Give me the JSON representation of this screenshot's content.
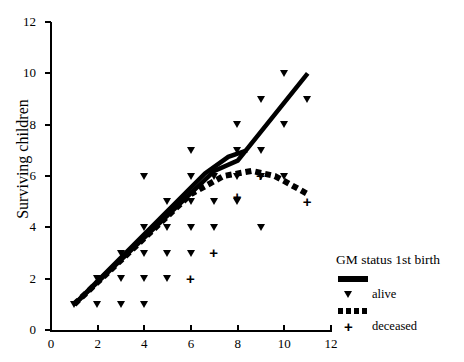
{
  "chart_data": {
    "type": "scatter",
    "title": "",
    "xlabel": "",
    "ylabel": "Surviving children",
    "xlim": [
      0,
      12
    ],
    "ylim": [
      0,
      12
    ],
    "xticks": [
      0,
      2,
      4,
      6,
      8,
      10,
      12
    ],
    "yticks": [
      0,
      2,
      4,
      6,
      8,
      10,
      12
    ],
    "grid": false,
    "legend": {
      "position": "right",
      "title": "GM status 1st birth",
      "entries": [
        {
          "key": "solid-line",
          "label": ""
        },
        {
          "key": "triangle-marker",
          "label": "alive"
        },
        {
          "key": "dashed-line",
          "label": ""
        },
        {
          "key": "plus-marker",
          "label": "deceased"
        }
      ]
    },
    "series": [
      {
        "name": "alive",
        "marker": "triangle-down",
        "points": [
          [
            1,
            1
          ],
          [
            2,
            1
          ],
          [
            3,
            1
          ],
          [
            4,
            1
          ],
          [
            2,
            2
          ],
          [
            3,
            2
          ],
          [
            4,
            2
          ],
          [
            5,
            2
          ],
          [
            3,
            3
          ],
          [
            4,
            3
          ],
          [
            5,
            3
          ],
          [
            6,
            3
          ],
          [
            4,
            4
          ],
          [
            5,
            4
          ],
          [
            6,
            4
          ],
          [
            7,
            4
          ],
          [
            9,
            4
          ],
          [
            5,
            5
          ],
          [
            6,
            5
          ],
          [
            7,
            5
          ],
          [
            8,
            5
          ],
          [
            4,
            6
          ],
          [
            6,
            6
          ],
          [
            7,
            6
          ],
          [
            8,
            6
          ],
          [
            9,
            6
          ],
          [
            10,
            6
          ],
          [
            6,
            7
          ],
          [
            8,
            7
          ],
          [
            9,
            7
          ],
          [
            8,
            8
          ],
          [
            10,
            8
          ],
          [
            9,
            9
          ],
          [
            11,
            9
          ],
          [
            10,
            10
          ]
        ]
      },
      {
        "name": "deceased",
        "marker": "plus",
        "points": [
          [
            6,
            2
          ],
          [
            7,
            3
          ],
          [
            8,
            5.2
          ],
          [
            9,
            6
          ],
          [
            11,
            5
          ]
        ]
      }
    ],
    "fit_lines": [
      {
        "name": "alive-fit",
        "style": "solid",
        "path": [
          [
            1,
            1
          ],
          [
            7,
            6.2
          ],
          [
            8,
            6.6
          ],
          [
            11,
            10
          ]
        ]
      },
      {
        "name": "alive-fit-branch",
        "style": "solid",
        "path": [
          [
            1,
            1
          ],
          [
            6.6,
            6.1
          ],
          [
            7.6,
            6.75
          ],
          [
            8.4,
            7.0
          ]
        ]
      },
      {
        "name": "deceased-fit",
        "style": "dashed",
        "path": [
          [
            1,
            1
          ],
          [
            6,
            5.3
          ],
          [
            7.4,
            6.0
          ],
          [
            8.6,
            6.2
          ],
          [
            9.6,
            6.0
          ],
          [
            11,
            5.3
          ]
        ]
      }
    ]
  }
}
